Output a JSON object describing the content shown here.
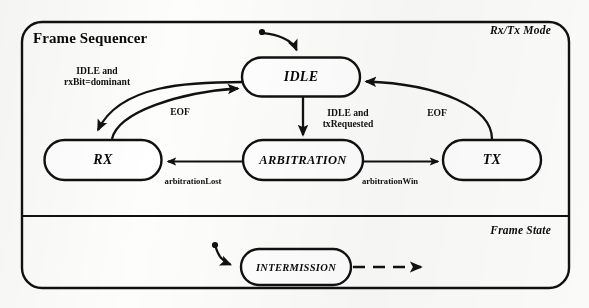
{
  "diagram": {
    "kind": "uml-state-machine",
    "outer_border": "rounded-rectangle",
    "stroke_color": "#101010",
    "background_color": "#fdfdfc",
    "frame_title": "Frame Sequencer",
    "lanes": [
      {
        "id": "rx-tx-mode",
        "title": "Rx/Tx Mode"
      },
      {
        "id": "frame-state",
        "title": "Frame State"
      }
    ],
    "states": [
      {
        "id": "idle",
        "label": "IDLE",
        "cx": 301,
        "cy": 77,
        "w": 118,
        "h": 39,
        "size": "big"
      },
      {
        "id": "rx",
        "label": "RX",
        "cx": 103,
        "cy": 160,
        "w": 117,
        "h": 40,
        "size": "big"
      },
      {
        "id": "arbitration",
        "label": "ARBITRATION",
        "cx": 303,
        "cy": 160,
        "w": 120,
        "h": 40,
        "size": "mid"
      },
      {
        "id": "tx",
        "label": "TX",
        "cx": 492,
        "cy": 160,
        "w": 98,
        "h": 40,
        "size": "big"
      },
      {
        "id": "intermission",
        "label": "INTERMISSION",
        "cx": 296,
        "cy": 267,
        "w": 110,
        "h": 36,
        "size": "small"
      }
    ],
    "transitions": [
      {
        "id": "initial-to-idle",
        "from": "initial-dot",
        "to": "idle",
        "label": "",
        "style": "solid"
      },
      {
        "id": "idle-to-rx",
        "from": "idle",
        "to": "rx",
        "label": "IDLE and\nrxBit=dominant",
        "label_line1": "IDLE and",
        "label_line2": "rxBit=dominant",
        "style": "solid"
      },
      {
        "id": "rx-to-idle",
        "from": "rx",
        "to": "idle",
        "label": "EOF",
        "style": "solid"
      },
      {
        "id": "idle-to-arbitration",
        "from": "idle",
        "to": "arbitration",
        "label": "IDLE and\ntxRequested",
        "label_line1": "IDLE and",
        "label_line2": "txRequested",
        "style": "solid"
      },
      {
        "id": "arbitration-to-rx",
        "from": "arbitration",
        "to": "rx",
        "label": "arbitrationLost",
        "style": "solid"
      },
      {
        "id": "arbitration-to-tx",
        "from": "arbitration",
        "to": "tx",
        "label": "arbitrationWin",
        "style": "solid"
      },
      {
        "id": "tx-to-idle",
        "from": "tx",
        "to": "idle",
        "label": "EOF",
        "style": "solid"
      },
      {
        "id": "initial-to-intermission",
        "from": "initial-dot-2",
        "to": "intermission",
        "label": "",
        "style": "solid"
      },
      {
        "id": "intermission-onward",
        "from": "intermission",
        "to": "",
        "label": "",
        "style": "dashed"
      }
    ],
    "edge_labels": [
      {
        "id": "label-idle-rx",
        "line1": "IDLE and",
        "line2": "rxBit=dominant",
        "x": 97,
        "y": 76
      },
      {
        "id": "label-rx-idle-eof",
        "text": "EOF",
        "x": 180,
        "y": 112
      },
      {
        "id": "label-idle-arbitration",
        "line1": "IDLE and",
        "line2": "txRequested",
        "x": 348,
        "y": 118
      },
      {
        "id": "label-tx-idle-eof",
        "text": "EOF",
        "x": 437,
        "y": 113
      },
      {
        "id": "label-arbitration-rx",
        "text": "arbitrationLost",
        "x": 193,
        "y": 180
      },
      {
        "id": "label-arbitration-tx",
        "text": "arbitrationWin",
        "x": 390,
        "y": 180
      }
    ]
  }
}
